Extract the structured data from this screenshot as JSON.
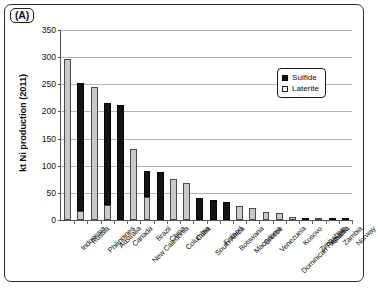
{
  "figure": {
    "panel_label": "(A)",
    "background_color": "#ffffff",
    "frame_color": "#2c2c2c"
  },
  "legend": {
    "position": "top-right-inside",
    "entries": [
      {
        "label": "Sulfide",
        "color": "#111111",
        "style": "filled-square"
      },
      {
        "label": "Laterite",
        "color": "#ffffff",
        "style": "open-square"
      }
    ]
  },
  "chart_data": {
    "type": "bar",
    "stacked": true,
    "title": "",
    "subtitle": "",
    "xlabel": "",
    "ylabel": "kt Ni production (2011)",
    "ylim": [
      0,
      350
    ],
    "yticks": [
      0,
      50,
      100,
      150,
      200,
      250,
      300,
      350
    ],
    "ytick_labels": [
      "0",
      "50",
      "100",
      "150",
      "200",
      "250",
      "300",
      "350"
    ],
    "grid": true,
    "grid_axis": "y",
    "legend_position": "upper right",
    "categories": [
      "Indonesia",
      "Russia",
      "Philippines",
      "Australia",
      "Canada",
      "New Caledonia",
      "Brazil",
      "China",
      "Columbia",
      "Cuba",
      "South Africa",
      "Finland",
      "Botswana",
      "Macedonia",
      "Greece",
      "Venezuela",
      "Dominican Republic",
      "Kosovo",
      "Zimbabwe",
      "Albania",
      "Zambia",
      "Norway"
    ],
    "series": [
      {
        "name": "Laterite",
        "color": "#c9c9c9",
        "values": [
          297,
          16,
          245,
          27,
          0,
          130,
          42,
          0,
          76,
          68,
          0,
          0,
          0,
          26,
          22,
          14,
          13,
          6,
          0,
          2,
          0,
          0
        ]
      },
      {
        "name": "Sulfide",
        "color": "#141414",
        "values": [
          0,
          237,
          0,
          188,
          212,
          0,
          49,
          89,
          0,
          0,
          40,
          37,
          33,
          0,
          0,
          0,
          0,
          0,
          4,
          0,
          2,
          1
        ]
      }
    ],
    "totals": [
      297,
      253,
      245,
      215,
      212,
      130,
      91,
      89,
      76,
      68,
      40,
      37,
      33,
      26,
      22,
      14,
      13,
      6,
      4,
      2,
      2,
      1
    ]
  }
}
